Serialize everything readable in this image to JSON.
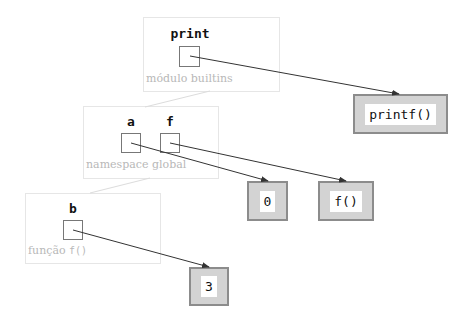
{
  "frames": [
    {
      "id": "builtins",
      "label_text": "módulo builtins",
      "label_code": ""
    },
    {
      "id": "global",
      "label_text": "namespace global",
      "label_code": ""
    },
    {
      "id": "func",
      "label_text": "função ",
      "label_code": "f()"
    }
  ],
  "variables": {
    "print": "print",
    "a": "a",
    "f": "f",
    "b": "b"
  },
  "objects": {
    "printf": "printf()",
    "zero": "0",
    "f_func": "f()",
    "three": "3"
  },
  "colors": {
    "frame_border": "#e6e6e6",
    "frame_label": "#b8b8b8",
    "object_fill": "#d3d3d3",
    "object_border": "#8c8c8c",
    "arrow": "#333333"
  }
}
